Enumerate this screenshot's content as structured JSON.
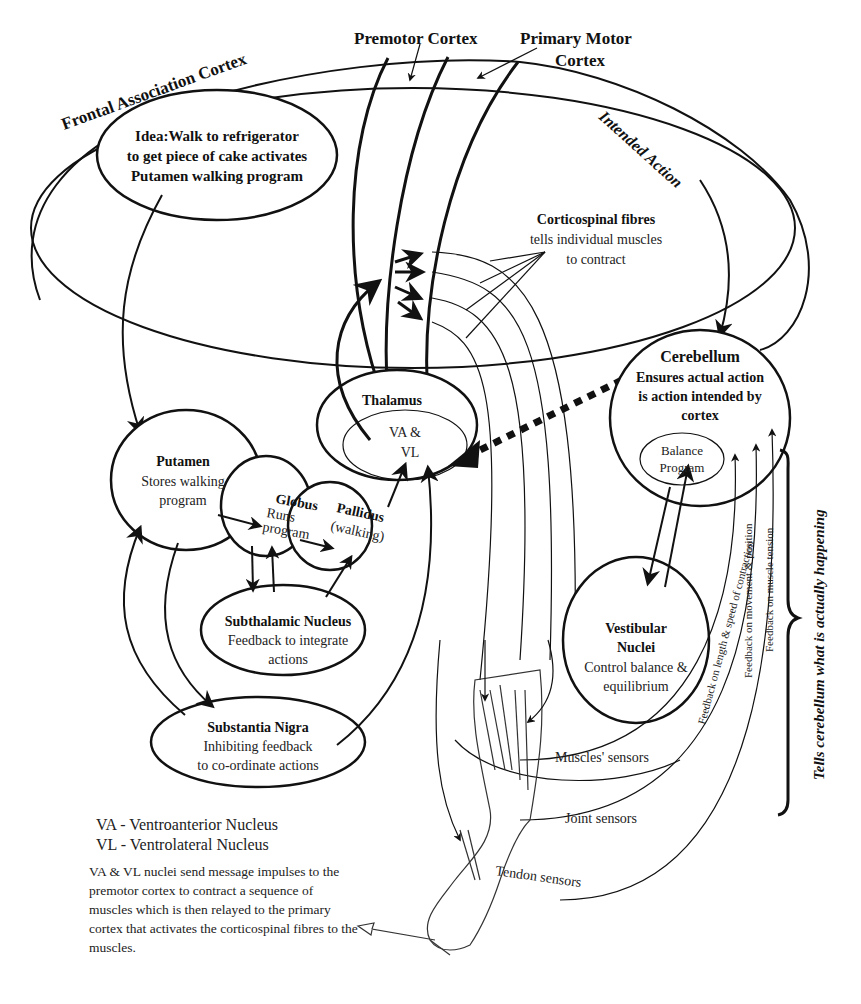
{
  "diagram": {
    "title_labels": {
      "frontal_association_cortex": "Frontal Association Cortex",
      "premotor_cortex": "Premotor Cortex",
      "primary_motor_cortex_line1": "Primary Motor",
      "primary_motor_cortex_line2": "Cortex",
      "intended_action": "Intended Action"
    },
    "nodes": {
      "idea": {
        "line1": "Idea:Walk to refrigerator",
        "line2": "to get piece of cake activates",
        "line3": "Putamen walking program"
      },
      "corticospinal": {
        "title": "Corticospinal fibres",
        "line1": "tells individual muscles",
        "line2": "to contract"
      },
      "thalamus": {
        "title": "Thalamus",
        "inner_line1": "VA &",
        "inner_line2": "VL"
      },
      "cerebellum": {
        "title": "Cerebellum",
        "line1": "Ensures actual action",
        "line2": "is action intended by",
        "line3": "cortex",
        "inner_line1": "Balance",
        "inner_line2": "Program"
      },
      "putamen": {
        "title": "Putamen",
        "line1": "Stores walking",
        "line2": "program"
      },
      "globus": {
        "title": "Globus",
        "line1": "Runs",
        "line2": "program"
      },
      "pallidus": {
        "title": "Pallidus",
        "line1": "(walking)"
      },
      "subthalamic": {
        "title": "Subthalamic Nucleus",
        "line1": "Feedback to integrate",
        "line2": "actions"
      },
      "substantia_nigra": {
        "title": "Substantia Nigra",
        "line1": "Inhibiting feedback",
        "line2": "to co-ordinate actions"
      },
      "vestibular": {
        "title_line1": "Vestibular",
        "title_line2": "Nuclei",
        "line1": "Control balance &",
        "line2": "equilibrium"
      }
    },
    "feedback_labels": {
      "length_speed": "Feedback  on length &  speed of contraction",
      "movement_position": "Feedback on movement & position",
      "muscle_tension": "Feedback on muscle tension"
    },
    "sensor_labels": {
      "muscles": "Muscles' sensors",
      "joint": "Joint sensors",
      "tendon": "Tendon sensors"
    },
    "brace_label": "Tells cerebellum what is actually happening",
    "legend": {
      "va": "VA - Ventroanterior  Nucleus",
      "vl": "VL - Ventrolateral  Nucleus"
    },
    "note": "VA & VL nuclei send message impulses to the premotor cortex to contract a sequence of muscles which is then relayed to the primary cortex that activates the corticospinal fibres to the muscles."
  }
}
